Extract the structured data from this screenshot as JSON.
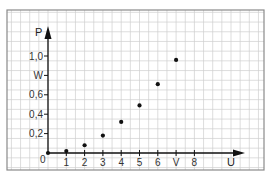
{
  "chart_data": {
    "type": "scatter",
    "title": "",
    "xlabel": "U",
    "ylabel": "P",
    "x_unit_label": "V",
    "y_unit_label": "W",
    "xlim": [
      0,
      9.5
    ],
    "ylim": [
      0,
      1.2
    ],
    "grid": true,
    "x_ticks": [
      {
        "value": 0,
        "label": "0"
      },
      {
        "value": 1,
        "label": "1"
      },
      {
        "value": 2,
        "label": "2"
      },
      {
        "value": 3,
        "label": "3"
      },
      {
        "value": 4,
        "label": "4"
      },
      {
        "value": 5,
        "label": "5"
      },
      {
        "value": 6,
        "label": "6"
      },
      {
        "value": 7,
        "label": "V"
      },
      {
        "value": 8,
        "label": "8"
      }
    ],
    "y_ticks": [
      {
        "value": 0.2,
        "label": "0,2"
      },
      {
        "value": 0.4,
        "label": "0,4"
      },
      {
        "value": 0.6,
        "label": "0,6"
      },
      {
        "value": 0.8,
        "label": "W"
      },
      {
        "value": 1.0,
        "label": "1,0"
      }
    ],
    "series": [
      {
        "name": "P(U)",
        "x": [
          0,
          1,
          2,
          3,
          4,
          5,
          6,
          7
        ],
        "y": [
          0,
          0.02,
          0.08,
          0.18,
          0.32,
          0.49,
          0.71,
          0.96
        ]
      }
    ]
  },
  "colors": {
    "grid": "#cfcfcf",
    "frame": "#8a8a8a",
    "axis": "#111111",
    "point": "#111111"
  }
}
